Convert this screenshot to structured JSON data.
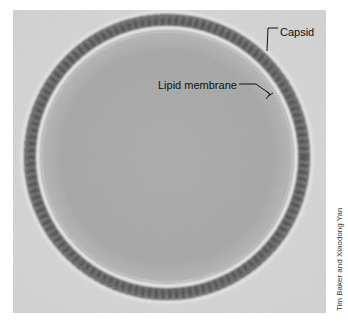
{
  "figure": {
    "type": "electron micrograph",
    "labels": [
      {
        "id": "capsid",
        "text": "Capsid"
      },
      {
        "id": "lipid_membrane",
        "text": "Lipid membrane"
      }
    ],
    "credit": "Tim Baker and Xiaodong Yan",
    "colors": {
      "background": "#d9d9d9",
      "interior": "#a9a9a9",
      "capsid_band": "#5e5e5e",
      "membrane_ring": "#e6e6e6",
      "label_text": "#111111"
    }
  }
}
